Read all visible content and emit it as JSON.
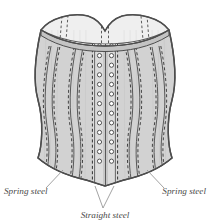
{
  "figure": {
    "background_color": "#ffffff",
    "fabric_fill": "#d3d3d3",
    "inner_fill": "#efefef",
    "binding_fill": "#bdbdbd",
    "channel_fill": "#dcdcdc",
    "outline_color": "#4d4d4d",
    "stitch_color": "#3a3a3a",
    "eyelet_ring_color": "#4d4d4d",
    "eyelet_hole_color": "#ffffff",
    "leader_color": "#8a8a8a",
    "label_color": "#4a4a4a"
  },
  "callouts": [
    {
      "id": "spring-steel-left",
      "label": "Spring steel",
      "x": 4,
      "y": 194,
      "anchor": "start"
    },
    {
      "id": "spring-steel-right",
      "label": "Spring steel",
      "x": 206,
      "y": 194,
      "anchor": "end"
    },
    {
      "id": "straight-steel-center",
      "label": "Straight steel",
      "x": 105,
      "y": 218,
      "anchor": "middle"
    }
  ],
  "busk": {
    "eyelet_rows": 13,
    "eyelet_columns": 2,
    "eyelet_radius": 2.1,
    "top_y": 46,
    "row_spacing": 9.6,
    "left_column_x": 99.5,
    "right_column_x": 111.5
  },
  "boning": {
    "spring_steel_count": 4,
    "straight_steel_count": 2,
    "description": "curved spring steel bones at sides, straight steel busk at center front"
  }
}
